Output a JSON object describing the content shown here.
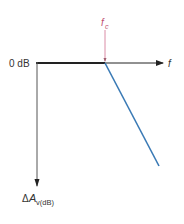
{
  "diagram": {
    "type": "bode-magnitude-asymptote",
    "labels": {
      "zero_db": "0 dB",
      "x_axis": "f",
      "cutoff": "f",
      "cutoff_sub": "c",
      "y_axis_delta": "Δ",
      "y_axis_main": "A",
      "y_axis_sub": "v(dB)"
    },
    "colors": {
      "axis": "#222222",
      "cutoff_marker": "#d07090",
      "rolloff_line": "#3a7ab5",
      "label_text": "#333333"
    }
  }
}
